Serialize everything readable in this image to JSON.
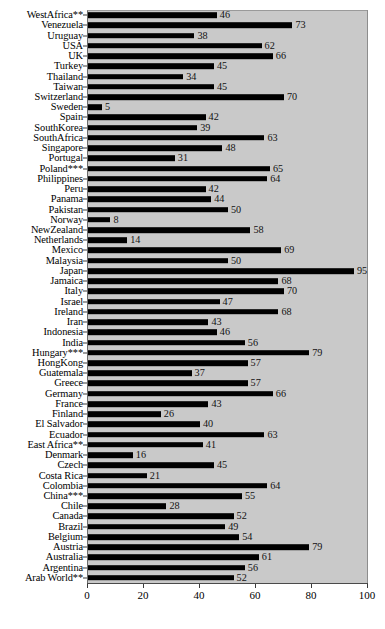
{
  "chart_data": {
    "type": "bar",
    "orientation": "horizontal",
    "title": "",
    "xlabel": "",
    "ylabel": "",
    "xlim": [
      0,
      100
    ],
    "xticks": [
      0,
      20,
      40,
      60,
      80,
      100
    ],
    "grid": false,
    "legend": null,
    "bar_color": "#000000",
    "plot_background": "#c9c9c9",
    "page_background": "#ffffff",
    "value_labels": true,
    "categories": [
      "WestAfrica**",
      "Venezuela",
      "Uruguay",
      "USA",
      "UK",
      "Turkey",
      "Thailand",
      "Taiwan",
      "Switzerland",
      "Sweden",
      "Spain",
      "SouthKorea",
      "SouthAfrica",
      "Singapore",
      "Portugal",
      "Poland***",
      "Philippines",
      "Peru",
      "Panama",
      "Pakistan",
      "Norway",
      "NewZealand",
      "Netherlands",
      "Mexico",
      "Malaysia",
      "Japan",
      "Jamaica",
      "Italy",
      "Israel",
      "Ireland",
      "Iran",
      "Indonesia",
      "India",
      "Hungary***",
      "HongKong",
      "Guatemala",
      "Greece",
      "Germany",
      "France",
      "Finland",
      "El Salvador",
      "Ecuador",
      "East Africa**",
      "Denmark",
      "Czech",
      "Costa Rica",
      "Colombia",
      "China***",
      "Chile",
      "Canada",
      "Brazil",
      "Belgium",
      "Austria",
      "Australia",
      "Argentina",
      "Arab World**"
    ],
    "values": [
      46,
      73,
      38,
      62,
      66,
      45,
      34,
      45,
      70,
      5,
      42,
      39,
      63,
      48,
      31,
      65,
      64,
      42,
      44,
      50,
      8,
      58,
      14,
      69,
      50,
      95,
      68,
      70,
      47,
      68,
      43,
      46,
      56,
      79,
      57,
      37,
      57,
      66,
      43,
      26,
      40,
      63,
      41,
      16,
      45,
      21,
      64,
      55,
      28,
      52,
      49,
      54,
      79,
      61,
      56,
      52
    ]
  }
}
